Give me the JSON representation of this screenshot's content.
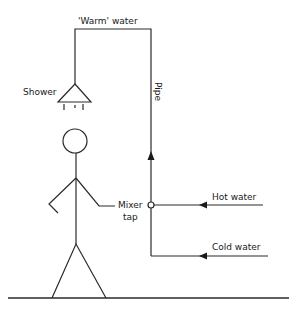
{
  "diagram": {
    "type": "shower-mixer-tap-schematic",
    "labels": {
      "warm_water": "'Warm' water",
      "shower": "Shower",
      "pipe": "Pipe",
      "mixer_tap_line1": "Mixer",
      "mixer_tap_line2": "tap",
      "hot_water": "Hot water",
      "cold_water": "Cold water"
    },
    "nodes": [
      {
        "id": "shower",
        "label": "Shower",
        "shape": "triangle"
      },
      {
        "id": "mixer-tap",
        "label": "Mixer tap",
        "shape": "small-circle"
      },
      {
        "id": "person",
        "label": "",
        "shape": "stick-figure"
      },
      {
        "id": "hot-water-inlet",
        "label": "Hot water"
      },
      {
        "id": "cold-water-inlet",
        "label": "Cold water"
      }
    ],
    "edges": [
      {
        "from": "hot-water-inlet",
        "to": "mixer-tap",
        "direction": "leftward-arrow"
      },
      {
        "from": "cold-water-inlet",
        "to": "mixer-tap",
        "direction": "leftward-arrow"
      },
      {
        "from": "mixer-tap",
        "to": "shower",
        "via": "Pipe",
        "direction": "upward-arrow",
        "carries": "'Warm' water"
      }
    ],
    "colors": {
      "line": "#2a2a2a",
      "background": "#ffffff"
    }
  }
}
